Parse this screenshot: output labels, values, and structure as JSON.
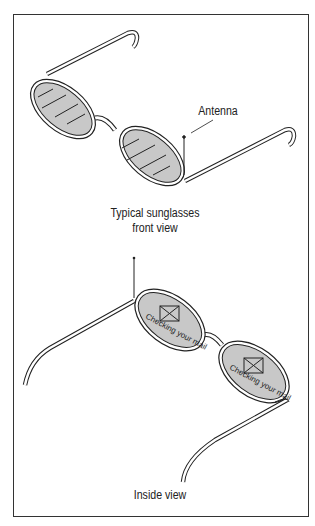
{
  "diagram": {
    "top": {
      "callout_label": "Antenna",
      "caption_line1": "Typical sunglasses",
      "caption_line2": "front view"
    },
    "bottom": {
      "left_lens_text": "Checking your mail",
      "right_lens_text": "Checking your mail",
      "lens_icon": "envelope-icon",
      "caption": "Inside view"
    },
    "colors": {
      "lens_fill": "#c8c8c8",
      "line": "#222222",
      "background": "#ffffff"
    }
  }
}
